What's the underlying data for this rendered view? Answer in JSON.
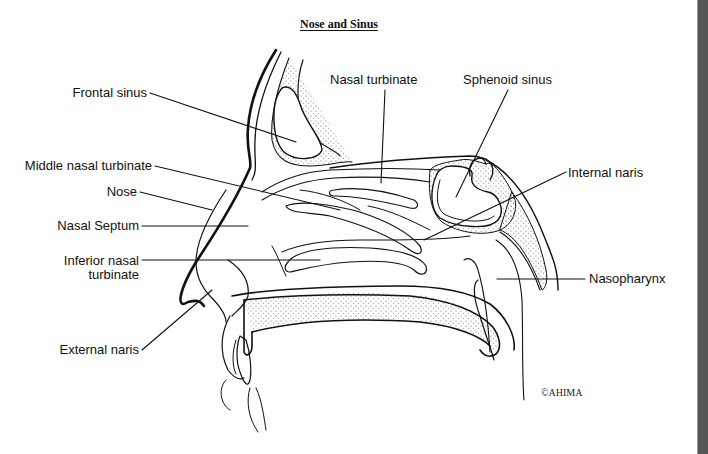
{
  "diagram": {
    "title": "Nose and Sinus",
    "labels": {
      "frontal_sinus": "Frontal sinus",
      "nasal_turbinate": "Nasal turbinate",
      "sphenoid_sinus": "Sphenoid sinus",
      "middle_nasal_turbinate": "Middle nasal turbinate",
      "internal_naris": "Internal naris",
      "nose": "Nose",
      "nasal_septum": "Nasal Septum",
      "inferior_nasal_turbinate_line1": "Inferior nasal",
      "inferior_nasal_turbinate_line2": "turbinate",
      "nasopharynx": "Nasopharynx",
      "external_naris": "External naris"
    },
    "copyright": "©AHIMA"
  },
  "colors": {
    "background": "#ffffff",
    "line": "#111111",
    "sidebar": "#555555"
  }
}
